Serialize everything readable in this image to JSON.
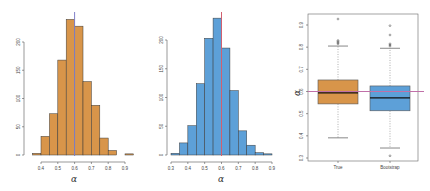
{
  "chart_data": [
    {
      "type": "bar",
      "subtype": "histogram",
      "title": "",
      "xlabel": "α",
      "ylabel": "",
      "bin_width": 0.05,
      "bins": [
        0.35,
        0.4,
        0.45,
        0.5,
        0.55,
        0.6,
        0.65,
        0.7,
        0.75,
        0.8,
        0.85,
        0.9
      ],
      "values": [
        3,
        33,
        73,
        168,
        240,
        228,
        130,
        88,
        30,
        8,
        0,
        2
      ],
      "xticks": [
        "0.4",
        "0.5",
        "0.6",
        "0.7",
        "0.8",
        "0.9"
      ],
      "yticks": [
        "0",
        "50",
        "100",
        "150",
        "200"
      ],
      "xlim": [
        0.35,
        0.95
      ],
      "ylim": [
        0,
        240
      ],
      "fill_color": "#D8954A",
      "reference_line": {
        "orientation": "vertical",
        "value": 0.6,
        "color": "#8080C8"
      }
    },
    {
      "type": "bar",
      "subtype": "histogram",
      "title": "",
      "xlabel": "α",
      "ylabel": "",
      "bin_width": 0.05,
      "bins": [
        0.3,
        0.35,
        0.4,
        0.45,
        0.5,
        0.55,
        0.6,
        0.65,
        0.7,
        0.75,
        0.8,
        0.85
      ],
      "values": [
        3,
        21,
        51,
        124,
        203,
        238,
        186,
        112,
        42,
        17,
        4,
        2
      ],
      "xticks": [
        "0.3",
        "0.4",
        "0.5",
        "0.6",
        "0.7",
        "0.8",
        "0.9"
      ],
      "yticks": [
        "0",
        "50",
        "100",
        "150",
        "200"
      ],
      "xlim": [
        0.3,
        0.9
      ],
      "ylim": [
        0,
        240
      ],
      "fill_color": "#5DA0D8",
      "reference_line": {
        "orientation": "vertical",
        "value": 0.6,
        "color": "#D06070"
      }
    },
    {
      "type": "boxplot",
      "title": "",
      "xlabel": "",
      "ylabel": "α",
      "categories": [
        "True",
        "Bootstrap"
      ],
      "series": [
        {
          "name": "True",
          "color": "#D8954A",
          "whisker_low": 0.391,
          "q1": 0.544,
          "median": 0.594,
          "q3": 0.652,
          "whisker_high": 0.805,
          "outliers": [
            0.815,
            0.82,
            0.825,
            0.83,
            0.927
          ]
        },
        {
          "name": "Bootstrap",
          "color": "#5DA0D8",
          "whisker_low": 0.345,
          "q1": 0.513,
          "median": 0.571,
          "q3": 0.625,
          "whisker_high": 0.795,
          "outliers": [
            0.31,
            0.805,
            0.81,
            0.815,
            0.855,
            0.897
          ]
        }
      ],
      "yticks": [
        "0.3",
        "0.4",
        "0.5",
        "0.6",
        "0.7",
        "0.8",
        "0.9"
      ],
      "ylim": [
        0.28,
        0.95
      ],
      "grid": false,
      "reference_line": {
        "orientation": "horizontal",
        "value": 0.6,
        "color": "#C070A8"
      }
    }
  ]
}
